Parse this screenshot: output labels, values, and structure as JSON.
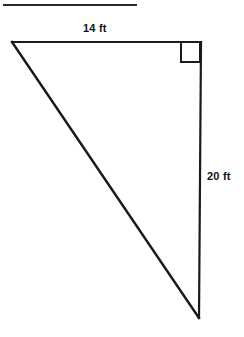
{
  "figure": {
    "background_color": "#ffffff",
    "stroke_color": "#1a1a1a",
    "separator": {
      "name": "top-rule",
      "x1": 3,
      "y1": 5,
      "x2": 137,
      "y2": 5,
      "thickness": 2,
      "color": "#2b2b2b"
    },
    "triangle": {
      "vertices": {
        "top_left": {
          "x": 12,
          "y": 42
        },
        "top_right": {
          "x": 201,
          "y": 42
        },
        "bottom_right": {
          "x": 199,
          "y": 318
        }
      },
      "stroke_width": 2.2
    },
    "right_angle_marker": {
      "name": "right-angle-square",
      "corner": "top_right",
      "x": 181,
      "y": 43,
      "size": 19,
      "stroke_width": 2
    },
    "labels": {
      "top_leg": {
        "text": "14 ft",
        "value": 14,
        "unit": "ft",
        "x": 83,
        "y": 22
      },
      "vertical_leg": {
        "text": "20 ft",
        "value": 20,
        "unit": "ft",
        "x": 207,
        "y": 170
      }
    }
  }
}
